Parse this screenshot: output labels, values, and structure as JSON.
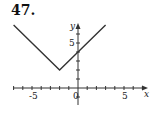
{
  "problem_number": "47.",
  "chart_data": {
    "type": "line",
    "title": "",
    "function": "y = |x + 2| + 2",
    "xlabel": "x",
    "ylabel": "y",
    "xlim": [
      -7,
      7
    ],
    "ylim": [
      -2,
      7.5
    ],
    "x_tick_labels": [
      {
        "value": -5,
        "label": "-5"
      },
      {
        "value": 0,
        "label": "0"
      },
      {
        "value": 5,
        "label": "5"
      }
    ],
    "y_tick_labels": [
      {
        "value": 5,
        "label": "5"
      }
    ],
    "series": [
      {
        "name": "graph",
        "x": [
          -7,
          -2,
          3
        ],
        "y": [
          7,
          2,
          7
        ]
      }
    ],
    "grid": false,
    "legend": null
  }
}
